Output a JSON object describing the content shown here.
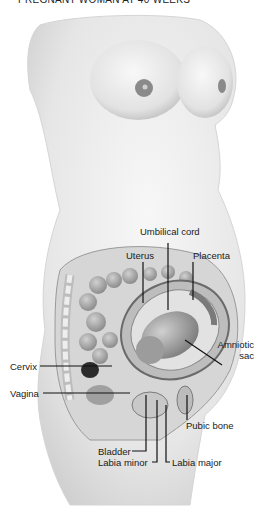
{
  "title": "PREGNANT WOMAN AT 40 WEEKS",
  "labels": {
    "umbilical_cord": "Umbilical cord",
    "uterus": "Uterus",
    "placenta": "Placenta",
    "amniotic_sac_line1": "Amniotic",
    "amniotic_sac_line2": "sac",
    "cervix": "Cervix",
    "vagina": "Vagina",
    "pubic_bone": "Pubic bone",
    "bladder": "Bladder",
    "labia_minor": "Labia minor",
    "labia_major": "Labia major"
  },
  "colors": {
    "background": "#ffffff",
    "skin": "#ececec",
    "skin_shadow": "#c9c9c9",
    "organ_dark": "#6e6e6e",
    "organ_mid": "#a6a6a6",
    "leader_line": "#111111"
  }
}
